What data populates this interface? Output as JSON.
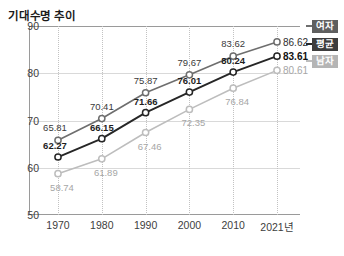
{
  "chart_data": {
    "type": "line",
    "title": "기대수명 추이",
    "xlabel": "",
    "ylabel": "",
    "categories": [
      "1970",
      "1980",
      "1990",
      "2000",
      "2010",
      "2021년"
    ],
    "ylim": [
      50,
      90
    ],
    "yticks": [
      "50",
      "60",
      "70",
      "80",
      "90"
    ],
    "grid": true,
    "legend_position": "right",
    "series": [
      {
        "name": "여자",
        "color": "#6e6e6e",
        "values": [
          65.81,
          70.41,
          75.87,
          79.67,
          83.62,
          86.62
        ],
        "labels": [
          "65.81",
          "70.41",
          "75.87",
          "79.67",
          "83.62",
          "86.62"
        ]
      },
      {
        "name": "평균",
        "color": "#262626",
        "values": [
          62.27,
          66.15,
          71.66,
          76.01,
          80.24,
          83.61
        ],
        "labels": [
          "62.27",
          "66.15",
          "71.66",
          "76.01",
          "80.24",
          "83.61"
        ]
      },
      {
        "name": "남자",
        "color": "#bdbdbd",
        "values": [
          58.74,
          61.89,
          67.46,
          72.35,
          76.84,
          80.61
        ],
        "labels": [
          "58.74",
          "61.89",
          "67.46",
          "72.35",
          "76.84",
          "80.61"
        ]
      }
    ]
  },
  "legend": {
    "items": [
      {
        "label": "여자",
        "badge_color": "#5f5f5f"
      },
      {
        "label": "평균",
        "badge_color": "#3d3d3d"
      },
      {
        "label": "남자",
        "badge_color": "#b5b5b5"
      }
    ]
  },
  "axis": {
    "y_labels": [
      "90",
      "80",
      "70",
      "60",
      "50"
    ],
    "x_labels": [
      "1970",
      "1980",
      "1990",
      "2000",
      "2010",
      "2021년"
    ]
  }
}
